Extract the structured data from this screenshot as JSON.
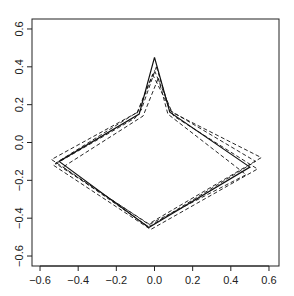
{
  "chart_data": {
    "type": "line",
    "title": "",
    "xlabel": "",
    "ylabel": "",
    "xlim": [
      -0.62,
      0.65
    ],
    "ylim": [
      -0.65,
      0.64
    ],
    "grid": false,
    "legend": null,
    "x_ticks": [
      -0.6,
      -0.4,
      -0.2,
      0.0,
      0.2,
      0.4,
      0.6
    ],
    "y_ticks": [
      -0.6,
      -0.4,
      -0.2,
      0.0,
      0.2,
      0.4,
      0.6
    ],
    "x_tick_labels": [
      "-0.6",
      "-0.4",
      "-0.2",
      "0.0",
      "0.2",
      "0.4",
      "0.6"
    ],
    "y_tick_labels": [
      "-0.6",
      "-0.4",
      "-0.2",
      "0.0",
      "0.2",
      "0.4",
      "0.6"
    ],
    "series": [
      {
        "name": "solid",
        "style": "solid",
        "x": [
          0.0,
          0.08,
          0.5,
          -0.03,
          -0.5,
          -0.08,
          0.0
        ],
        "y": [
          0.45,
          0.16,
          -0.13,
          -0.45,
          -0.1,
          0.15,
          0.45
        ]
      },
      {
        "name": "dashed-1",
        "style": "dashed",
        "x": [
          0.01,
          0.08,
          0.53,
          -0.02,
          -0.54,
          -0.07,
          0.01
        ],
        "y": [
          0.4,
          0.17,
          -0.1,
          -0.44,
          -0.09,
          0.17,
          0.4
        ]
      },
      {
        "name": "dashed-2",
        "style": "dashed",
        "x": [
          -0.01,
          0.09,
          0.56,
          -0.03,
          -0.52,
          -0.09,
          -0.01
        ],
        "y": [
          0.36,
          0.16,
          -0.08,
          -0.43,
          -0.11,
          0.16,
          0.36
        ]
      },
      {
        "name": "dashed-3",
        "style": "dashed",
        "x": [
          0.02,
          0.07,
          0.48,
          -0.04,
          -0.48,
          -0.06,
          0.02
        ],
        "y": [
          0.34,
          0.15,
          -0.17,
          -0.44,
          -0.13,
          0.14,
          0.34
        ]
      },
      {
        "name": "dashed-4",
        "style": "dashed",
        "x": [
          0.0,
          0.1,
          0.54,
          -0.02,
          -0.53,
          -0.1,
          0.0
        ],
        "y": [
          0.38,
          0.14,
          -0.14,
          -0.46,
          -0.12,
          0.13,
          0.38
        ]
      }
    ]
  }
}
